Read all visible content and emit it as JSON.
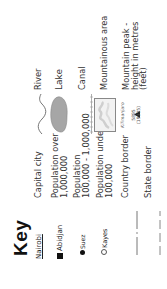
{
  "title": "Key",
  "left_column": [
    {
      "symbol_text": "Nairobi",
      "symbol_type": "underlined-name",
      "label": "Capital city"
    },
    {
      "symbol_text": "Abidjan",
      "symbol_type": "filled-square",
      "label_line1": "Population over",
      "label_line2": "1,000,000"
    },
    {
      "symbol_text": "Suez",
      "symbol_type": "filled-dot",
      "label_line1": "Population",
      "label_line2": "100,000 - 1,000,000"
    },
    {
      "symbol_text": "Kayes",
      "symbol_type": "open-circle",
      "label_line1": "Population under",
      "label_line2": "100,000"
    },
    {
      "symbol_type": "dash-dot-line",
      "label": "Country border"
    },
    {
      "symbol_type": "dashed-line",
      "label": "State border"
    }
  ],
  "right_column": [
    {
      "symbol_type": "wavy-line",
      "label": "River"
    },
    {
      "symbol_type": "lake-shape",
      "label": "Lake"
    },
    {
      "symbol_type": "dotted-line",
      "label": "Canal"
    },
    {
      "symbol_type": "shaded-box",
      "label": "Mountainous area"
    },
    {
      "symbol_type": "triangle-peak",
      "peak_name": "Kilimanjaro",
      "peak_metres": "5895",
      "peak_feet": "(19335)",
      "label_line1": "Mountain peak -",
      "label_line2": "height in metres",
      "label_line3": "(feet)"
    }
  ],
  "colors": {
    "text": "#333333",
    "title": "#111111",
    "lake_fill": "#a6a6a6",
    "border_lines": "#777777"
  }
}
